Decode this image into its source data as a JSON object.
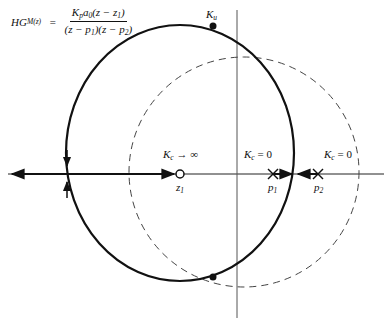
{
  "equation": {
    "lhs": "HG",
    "lhs_sub": "M(z)",
    "equals": "=",
    "numerator": "K_p a_0 (z − z_1)",
    "numerator_parts": [
      "K",
      "p",
      "a",
      "0",
      "(z − z",
      "1",
      ")"
    ],
    "denominator": "(z − p_1)(z − p_2)",
    "denominator_parts": [
      "(z − p",
      "1",
      ")(z − p",
      "2",
      ")"
    ]
  },
  "labels": {
    "ku": {
      "main": "K",
      "sub": "u"
    },
    "kc_inf": {
      "main": "K",
      "sub": "c",
      "rest": " → ∞"
    },
    "kc_p1": {
      "main": "K",
      "sub": "c",
      "rest": " = 0"
    },
    "kc_p2": {
      "main": "K",
      "sub": "c",
      "rest": " = 0"
    },
    "z1": {
      "main": "z",
      "sub": "1"
    },
    "p1": {
      "main": "p",
      "sub": "1"
    },
    "p2": {
      "main": "p",
      "sub": "2"
    }
  },
  "diagram": {
    "type": "root-locus",
    "zero": {
      "name": "z1",
      "x": 180,
      "y": 174
    },
    "poles": [
      {
        "name": "p1",
        "x": 273,
        "y": 174
      },
      {
        "name": "p2",
        "x": 318,
        "y": 174
      }
    ],
    "unit_circle": "dashed",
    "locus_circle": "solid",
    "ultimate_gain_points": [
      "Ku top",
      "Ku bottom"
    ]
  }
}
